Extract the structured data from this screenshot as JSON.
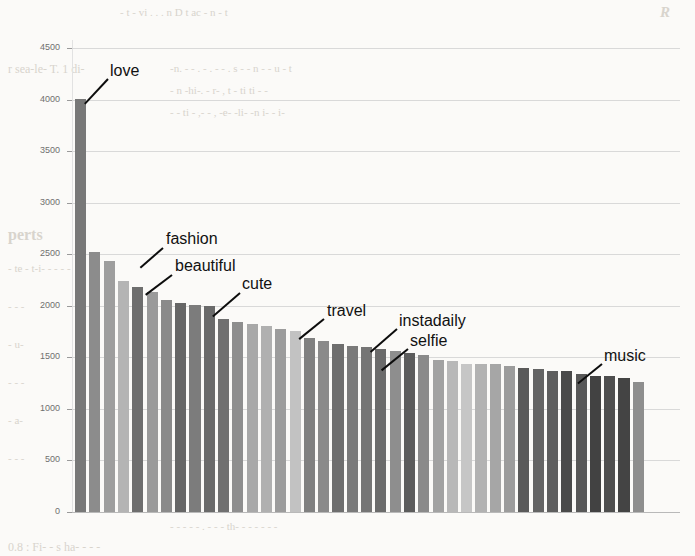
{
  "chart_data": {
    "type": "bar",
    "title": "",
    "xlabel": "",
    "ylabel": "",
    "ylim": [
      0,
      4500
    ],
    "grid": true,
    "legend": "none",
    "yticks": [
      0,
      500,
      1000,
      1500,
      2000,
      2500,
      3000,
      3500,
      4000,
      4500
    ],
    "ytick_labels": [
      "0",
      "500",
      "1000",
      "1500",
      "2000",
      "2500",
      "3000",
      "3500",
      "4000",
      "4500"
    ],
    "xtick_labels": [],
    "categories": [
      "love",
      "bar2",
      "fashion",
      "bar4",
      "beautiful",
      "bar6",
      "bar7",
      "bar8",
      "bar9",
      "cute",
      "bar11",
      "bar12",
      "bar13",
      "bar14",
      "bar15",
      "travel",
      "bar17",
      "bar18",
      "bar19",
      "bar20",
      "instadaily",
      "selfie",
      "bar23",
      "bar24",
      "bar25",
      "bar26",
      "bar27",
      "bar28",
      "bar29",
      "bar30",
      "bar31",
      "bar32",
      "bar33",
      "bar34",
      "music",
      "bar36",
      "bar37",
      "bar38",
      "bar39",
      "bar40"
    ],
    "values": [
      4005,
      2525,
      2435,
      2245,
      2185,
      2130,
      2055,
      2030,
      2005,
      1995,
      1875,
      1845,
      1825,
      1805,
      1775,
      1760,
      1685,
      1660,
      1625,
      1610,
      1600,
      1580,
      1560,
      1540,
      1520,
      1475,
      1465,
      1440,
      1440,
      1435,
      1420,
      1395,
      1385,
      1370,
      1365,
      1340,
      1320,
      1315,
      1295,
      1265
    ],
    "bar_colors": [
      "#787878",
      "#8c8c8c",
      "#9e9e9e",
      "#b4b4b4",
      "#6e6e6e",
      "#9a9a9a",
      "#8a8a8a",
      "#666666",
      "#7c7c7c",
      "#6a6a6a",
      "#707070",
      "#8e8e8e",
      "#a8a8a8",
      "#b0b0b0",
      "#9c9c9c",
      "#c2c2c2",
      "#808080",
      "#8a8a8a",
      "#6e6e6e",
      "#7a7a7a",
      "#757575",
      "#6b6b6b",
      "#8e8e8e",
      "#5c5c5c",
      "#8a8a8a",
      "#a2a2a2",
      "#b8b8b8",
      "#c6c6c6",
      "#b2b2b2",
      "#a6a6a6",
      "#9c9c9c",
      "#5a5a5a",
      "#646464",
      "#5e5e5e",
      "#4a4a4a",
      "#585858",
      "#424242",
      "#4e4e4e",
      "#444444",
      "#8e8e8e"
    ],
    "annotations": [
      {
        "label": "love",
        "label_x": 110,
        "label_y": 62,
        "line_x": 108,
        "line_y": 78,
        "line_len": 34,
        "line_angle": 133
      },
      {
        "label": "fashion",
        "label_x": 166,
        "label_y": 230,
        "line_x": 163,
        "line_y": 247,
        "line_len": 30,
        "line_angle": 139
      },
      {
        "label": "beautiful",
        "label_x": 175,
        "label_y": 257,
        "line_x": 172,
        "line_y": 274,
        "line_len": 33,
        "line_angle": 143
      },
      {
        "label": "cute",
        "label_x": 242,
        "label_y": 275,
        "line_x": 240,
        "line_y": 292,
        "line_len": 36,
        "line_angle": 139
      },
      {
        "label": "travel",
        "label_x": 327,
        "label_y": 302,
        "line_x": 324,
        "line_y": 318,
        "line_len": 32,
        "line_angle": 141
      },
      {
        "label": "instadaily",
        "label_x": 399,
        "label_y": 312,
        "line_x": 397,
        "line_y": 328,
        "line_len": 35,
        "line_angle": 139
      },
      {
        "label": "selfie",
        "label_x": 410,
        "label_y": 332,
        "line_x": 408,
        "line_y": 348,
        "line_len": 34,
        "line_angle": 141
      },
      {
        "label": "music",
        "label_x": 604,
        "label_y": 347,
        "line_x": 602,
        "line_y": 363,
        "line_len": 31,
        "line_angle": 141
      }
    ]
  },
  "background_text": [
    {
      "text": "R",
      "x": 660,
      "y": 4,
      "size": 15,
      "style": "it bold"
    },
    {
      "text": "-  t  -  vi . . .  n   D   t   ac   -  n   -  t",
      "x": 120,
      "y": 6,
      "size": 11,
      "style": ""
    },
    {
      "text": "r sea-le- T. 1 di-",
      "x": 8,
      "y": 62,
      "size": 12,
      "style": ""
    },
    {
      "text": "-n.  -  -    . -  .  -     - .  s  -    -  n -  - u   -   t",
      "x": 170,
      "y": 62,
      "size": 11,
      "style": ""
    },
    {
      "text": "- n  -hi-.  -     r-  ,  t  -   ti   ti    -   -",
      "x": 170,
      "y": 84,
      "size": 11,
      "style": ""
    },
    {
      "text": "-  -  ti   -  ,-   -  ,  -e-  -li-  -n   i-   -   i-",
      "x": 170,
      "y": 106,
      "size": 11,
      "style": ""
    },
    {
      "text": "perts",
      "x": 8,
      "y": 226,
      "size": 16,
      "style": "bold"
    },
    {
      "text": "- te - t-i- -  -  -  -",
      "x": 8,
      "y": 262,
      "size": 11,
      "style": ""
    },
    {
      "text": "- -  -",
      "x": 8,
      "y": 300,
      "size": 11,
      "style": ""
    },
    {
      "text": "- u-",
      "x": 8,
      "y": 338,
      "size": 11,
      "style": ""
    },
    {
      "text": "- - -",
      "x": 8,
      "y": 376,
      "size": 11,
      "style": ""
    },
    {
      "text": "- a-",
      "x": 8,
      "y": 414,
      "size": 11,
      "style": ""
    },
    {
      "text": "-  -  -",
      "x": 8,
      "y": 452,
      "size": 11,
      "style": ""
    },
    {
      "text": "-    -  -   -  - . -  -    -  th-  -  -  -  -  -  -",
      "x": 170,
      "y": 520,
      "size": 11,
      "style": ""
    },
    {
      "text": "0.8 :  Fi-  -  s  ha-   -  -  -",
      "x": 8,
      "y": 540,
      "size": 12,
      "style": ""
    }
  ],
  "layout": {
    "plot_left": 72,
    "plot_right": 680,
    "plot_top": 48,
    "plot_bottom": 512,
    "bar_start": 75,
    "bar_pitch": 14.3,
    "bar_width": 11.2
  }
}
